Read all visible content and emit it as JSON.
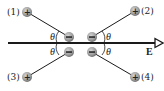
{
  "figure": {
    "field": {
      "label": "E",
      "direction": "right",
      "y": 43,
      "x_start": 8,
      "x_end": 163
    },
    "angle_label": "θ",
    "dipoles": [
      {
        "id": "1",
        "label": "(1)",
        "plus": [
          27,
          12
        ],
        "minus": [
          69,
          37
        ],
        "angle_side": "left"
      },
      {
        "id": "2",
        "label": "(2)",
        "plus": [
          135,
          11
        ],
        "minus": [
          92,
          37
        ],
        "angle_side": "right"
      },
      {
        "id": "3",
        "label": "(3)",
        "plus": [
          27,
          77
        ],
        "minus": [
          69,
          52
        ],
        "angle_side": "left"
      },
      {
        "id": "4",
        "label": "(4)",
        "plus": [
          135,
          77
        ],
        "minus": [
          92,
          52
        ],
        "angle_side": "right"
      }
    ],
    "charge_signs": {
      "positive": "+",
      "negative": "−"
    },
    "colors": {
      "charge_fill": "#9a9a9a",
      "charge_dark": "#6e6e6e",
      "line": "#1a1a1a"
    }
  }
}
